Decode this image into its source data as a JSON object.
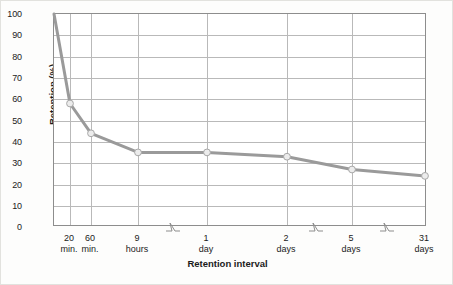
{
  "chart_data": {
    "type": "line",
    "title": "",
    "xlabel": "Retention interval",
    "ylabel": "Retention (%)",
    "ylim": [
      0,
      100
    ],
    "ytick_step": 10,
    "grid": true,
    "legend": null,
    "categories": [
      "0",
      "20 min.",
      "60 min.",
      "9 hours",
      "1 day",
      "2 days",
      "5 days",
      "31 days"
    ],
    "x_tick_labels": [
      {
        "line1": "20",
        "line2": "min."
      },
      {
        "line1": "60",
        "line2": "min."
      },
      {
        "line1": "9",
        "line2": "hours"
      },
      {
        "line1": "1",
        "line2": "day"
      },
      {
        "line1": "2",
        "line2": "days"
      },
      {
        "line1": "5",
        "line2": "days"
      },
      {
        "line1": "31",
        "line2": "days"
      }
    ],
    "y_tick_labels": [
      "100",
      "90",
      "80",
      "70",
      "60",
      "50",
      "40",
      "30",
      "20",
      "10",
      "0"
    ],
    "values": [
      100,
      58,
      44,
      35,
      35,
      33,
      27,
      24
    ],
    "series": [
      {
        "name": "Retention",
        "values": [
          100,
          58,
          44,
          35,
          35,
          33,
          27,
          24
        ],
        "color": "#9a9a9a",
        "marker_color": "#e8e8e8"
      }
    ],
    "axis_breaks": 3
  },
  "colors": {
    "line": "#9a9a9a",
    "marker_fill": "#ececec",
    "marker_stroke": "#a8a8a8",
    "grid": "#b9b9b9",
    "frame": "#8d8d8d",
    "text": "#1b1b1b",
    "background": "#fdfdfc"
  }
}
